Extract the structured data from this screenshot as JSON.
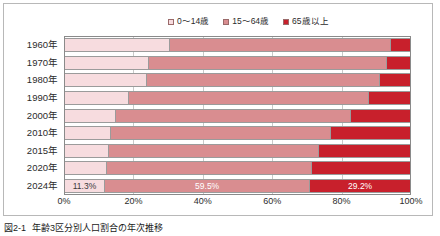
{
  "caption": {
    "number": "図2-1",
    "text": "年齢3区分別人口割合の年次推移"
  },
  "colors": {
    "young": "#f7dcdf",
    "working": "#d98d90",
    "elderly": "#c8202c",
    "grid": "#c9c9c9",
    "axis": "#8a8a8a",
    "frame": "#b8b8b8"
  },
  "chart_data": {
    "type": "bar",
    "orientation": "horizontal",
    "stacked": true,
    "normalized_percent": true,
    "title": "",
    "xlabel": "",
    "ylabel": "",
    "xlim": [
      0,
      100
    ],
    "xticks": [
      "0%",
      "20%",
      "40%",
      "60%",
      "80%",
      "100%"
    ],
    "xtick_values": [
      0,
      20,
      40,
      60,
      80,
      100
    ],
    "grid": true,
    "legend_position": "top-center",
    "categories": [
      "1960年",
      "1970年",
      "1980年",
      "1990年",
      "2000年",
      "2010年",
      "2015年",
      "2020年",
      "2024年"
    ],
    "series": [
      {
        "name": "0〜14歳",
        "color": "#f7dcdf",
        "values": [
          30.2,
          24.0,
          23.5,
          18.2,
          14.6,
          13.1,
          12.6,
          11.9,
          11.3
        ]
      },
      {
        "name": "15〜64歳",
        "color": "#d98d90",
        "values": [
          64.1,
          68.9,
          67.4,
          69.7,
          68.1,
          63.8,
          60.7,
          59.5,
          59.5
        ]
      },
      {
        "name": "65歳以上",
        "color": "#c8202c",
        "values": [
          5.7,
          7.1,
          9.1,
          12.1,
          17.3,
          23.1,
          26.7,
          28.6,
          29.2
        ]
      }
    ],
    "data_labels": {
      "row": "2024年",
      "values": [
        "11.3%",
        "59.5%",
        "29.2%"
      ]
    }
  }
}
